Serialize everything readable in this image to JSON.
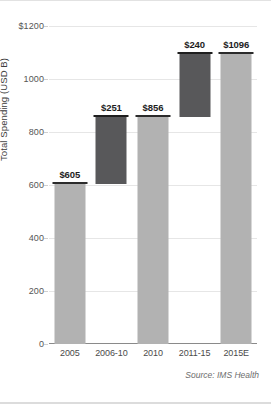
{
  "chart_data": {
    "type": "bar",
    "subtype": "waterfall",
    "title": "",
    "xlabel": "",
    "ylabel": "Total Spending (USD B)",
    "ylim": [
      0,
      1200
    ],
    "ytick_labels": [
      "0",
      "200",
      "400",
      "600",
      "800",
      "1000",
      "$1200"
    ],
    "ytick_values": [
      0,
      200,
      400,
      600,
      800,
      1000,
      1200
    ],
    "grid": true,
    "legend": "none",
    "categories": [
      "2005",
      "2006-10",
      "2010",
      "2011-15",
      "2015E"
    ],
    "values": [
      605,
      251,
      856,
      240,
      1096
    ],
    "data_labels": [
      "$605",
      "$251",
      "$856",
      "$240",
      "$1096"
    ],
    "bars": [
      {
        "category": "2005",
        "label": "$605",
        "value": 605,
        "base": 0,
        "top": 605,
        "kind": "total",
        "color": "#b2b2b2"
      },
      {
        "category": "2006-10",
        "label": "$251",
        "value": 251,
        "base": 605,
        "top": 856,
        "kind": "increment",
        "color": "#58585a"
      },
      {
        "category": "2010",
        "label": "$856",
        "value": 856,
        "base": 0,
        "top": 856,
        "kind": "total",
        "color": "#b2b2b2"
      },
      {
        "category": "2011-15",
        "label": "$240",
        "value": 240,
        "base": 856,
        "top": 1096,
        "kind": "increment",
        "color": "#58585a"
      },
      {
        "category": "2015E",
        "label": "$1096",
        "value": 1096,
        "base": 0,
        "top": 1096,
        "kind": "total",
        "color": "#b2b2b2"
      }
    ],
    "colors": {
      "total_bar": "#b2b2b2",
      "increment_bar": "#58585a",
      "bar_cap": "#2b2b2b",
      "gridline": "#e6e6e6",
      "axis": "#8a8a8a"
    }
  },
  "source_note": "Source: IMS Health"
}
